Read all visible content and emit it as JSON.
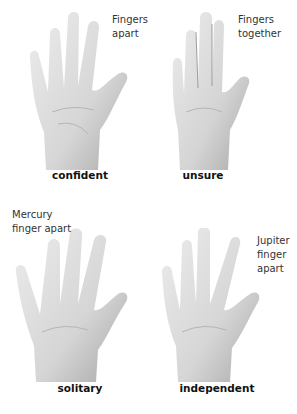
{
  "panels": [
    {
      "id": "confident",
      "note_lines": [
        "Fingers",
        "apart"
      ],
      "label": "confident",
      "description": "Open palm with all fingers spread apart"
    },
    {
      "id": "unsure",
      "note_lines": [
        "Fingers",
        "together"
      ],
      "label": "unsure",
      "description": "Open palm with fingers held closely together"
    },
    {
      "id": "solitary",
      "note_lines": [
        "Mercury",
        "finger apart"
      ],
      "label": "solitary",
      "description": "Open palm with little (Mercury) finger held apart"
    },
    {
      "id": "independent",
      "note_lines": [
        "Jupiter",
        "finger",
        "apart"
      ],
      "label": "independent",
      "description": "Open palm with index (Jupiter) finger held apart"
    }
  ],
  "colors": {
    "background": "#ffffff",
    "skin_light": "#e6e6e6",
    "skin_mid": "#cfcfcf",
    "skin_dark": "#9a9a9a",
    "text": "#333333",
    "label": "#111111"
  }
}
